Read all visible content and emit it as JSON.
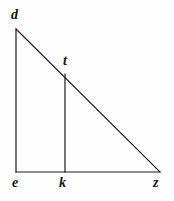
{
  "figure": {
    "kind": "geometry-diagram",
    "background_color": "#fefefe",
    "stroke_color": "#1c1c1c",
    "stroke_width": 1,
    "label_color": "#161616",
    "points": [
      {
        "id": "d",
        "label": "d",
        "x": 16,
        "y": 29
      },
      {
        "id": "t",
        "label": "t",
        "x": 65,
        "y": 74
      },
      {
        "id": "e",
        "label": "e",
        "x": 16,
        "y": 172
      },
      {
        "id": "k",
        "label": "k",
        "x": 65,
        "y": 172
      },
      {
        "id": "z",
        "label": "z",
        "x": 160,
        "y": 172
      }
    ],
    "segments": [
      {
        "id": "de",
        "from": "d",
        "to": "e",
        "name": "left-leg"
      },
      {
        "id": "ez",
        "from": "e",
        "to": "z",
        "name": "base"
      },
      {
        "id": "dz",
        "from": "d",
        "to": "z",
        "name": "hypotenuse"
      },
      {
        "id": "tk",
        "from": "t",
        "to": "k",
        "name": "cevian"
      }
    ]
  }
}
